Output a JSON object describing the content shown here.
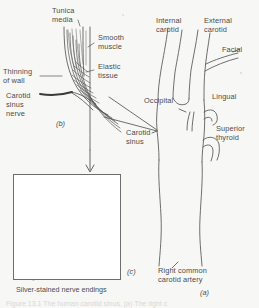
{
  "figure": {
    "type": "anatomical-diagram",
    "background_color": "#f7f7f5",
    "ink_color": "#4c4c4c"
  },
  "panel_a": {
    "id": "(a)",
    "labels": {
      "internal_carotid": "Internal\ncarotid",
      "external_carotid": "External\ncarotid",
      "facial": "Facial",
      "lingual": "Lingual",
      "occipital": "Occipital",
      "superior_thyroid": "Superior\nthyroid",
      "carotid_sinus": "Carotid\nsinus",
      "right_common_carotid": "Right common\ncarotid artery"
    }
  },
  "panel_b": {
    "id": "(b)",
    "labels": {
      "tunica_media": "Tunica\nmedia",
      "smooth_muscle": "Smooth\nmuscle",
      "elastic_tissue": "Elastic\ntissue",
      "thinning_of_wall": "Thinning\nof wall",
      "carotid_sinus_nerve": "Carotid\nsinus\nnerve"
    }
  },
  "panel_c": {
    "id": "(c)",
    "caption": "Silver-stained nerve endings"
  },
  "footer": {
    "clipped_caption": "Figure 13.1 The human carotid sinus. (a) The right c"
  }
}
